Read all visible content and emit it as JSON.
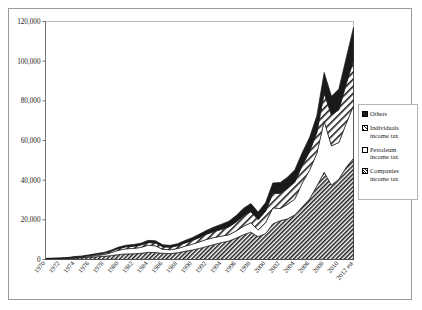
{
  "chart_data": {
    "type": "area",
    "stacked": true,
    "title": "",
    "xlabel": "",
    "ylabel": "",
    "ylim": [
      0,
      120000
    ],
    "yticks": [
      0,
      20000,
      40000,
      60000,
      80000,
      100000,
      120000
    ],
    "ytick_labels": [
      "0",
      "20,000",
      "40,000",
      "60,000",
      "80,000",
      "100,000",
      "120,000"
    ],
    "grid": false,
    "legend_position": "right",
    "x": [
      1970,
      1971,
      1972,
      1973,
      1974,
      1975,
      1976,
      1977,
      1978,
      1979,
      1980,
      1981,
      1982,
      1983,
      1984,
      1985,
      1986,
      1987,
      1988,
      1989,
      1990,
      1991,
      1992,
      1993,
      1994,
      1995,
      1996,
      1997,
      1998,
      1999,
      2000,
      2001,
      2002,
      2003,
      2004,
      2005,
      2006,
      2007,
      2008,
      2009,
      2010,
      2011,
      2012
    ],
    "xtick_labels": [
      "1970",
      "1972",
      "1974",
      "1976",
      "1978",
      "1980",
      "1982",
      "1984",
      "1986",
      "1988",
      "1990",
      "1992",
      "1994",
      "1996",
      "1998",
      "2000",
      "2002",
      "2004",
      "2006",
      "2008",
      "2010",
      "2012 est"
    ],
    "series": [
      {
        "name": "Companies income tax",
        "pattern": "fine-diagonal-hatch",
        "color": "#1a1a1a",
        "values": [
          280,
          340,
          400,
          520,
          760,
          900,
          1150,
          1400,
          1600,
          2000,
          2500,
          2800,
          2900,
          3100,
          3600,
          3500,
          3100,
          3000,
          3400,
          4100,
          4800,
          5600,
          6600,
          7600,
          8500,
          9300,
          10800,
          12500,
          13800,
          11500,
          13000,
          18000,
          19500,
          20500,
          22500,
          26500,
          30500,
          37000,
          44000,
          37500,
          40500,
          46500,
          51000
        ]
      },
      {
        "name": "Petroleum income tax",
        "pattern": "white",
        "color": "#ffffff",
        "values": [
          0,
          0,
          0,
          0,
          120,
          200,
          420,
          700,
          900,
          1500,
          2200,
          2600,
          2700,
          3000,
          3600,
          3400,
          2000,
          1900,
          2100,
          2600,
          2900,
          3300,
          3600,
          3500,
          3300,
          3200,
          3600,
          4300,
          4700,
          3400,
          5500,
          8000,
          6200,
          7300,
          8000,
          12000,
          14500,
          16500,
          25800,
          19800,
          18500,
          22000,
          26500
        ]
      },
      {
        "name": "Individuals income tax",
        "pattern": "wide-diagonal-hatch",
        "color": "#1a1a1a",
        "values": [
          180,
          200,
          230,
          280,
          340,
          400,
          460,
          540,
          620,
          740,
          900,
          1020,
          1100,
          1180,
          1350,
          1400,
          1320,
          1280,
          1400,
          1600,
          1850,
          2200,
          2600,
          3000,
          3400,
          3900,
          4500,
          5200,
          5600,
          5200,
          5800,
          7400,
          7700,
          8000,
          8600,
          8800,
          9300,
          10500,
          14000,
          15500,
          16500,
          20000,
          23000
        ]
      },
      {
        "name": "Others",
        "pattern": "solid-black",
        "color": "#1a1a1a",
        "values": [
          120,
          140,
          160,
          200,
          260,
          300,
          340,
          400,
          460,
          560,
          700,
          800,
          860,
          920,
          1100,
          1150,
          1000,
          950,
          1050,
          1250,
          1450,
          1700,
          2000,
          2300,
          2600,
          2900,
          3300,
          3800,
          4100,
          3800,
          4300,
          5200,
          5400,
          5700,
          6100,
          6500,
          7200,
          8500,
          10500,
          9500,
          10500,
          13000,
          16500
        ]
      }
    ]
  },
  "legend": {
    "items": [
      {
        "label_line1": "Others",
        "label_line2": "",
        "swatch": "solid-black"
      },
      {
        "label_line1": "Individuals",
        "label_line2": "income tax",
        "swatch": "wide-diagonal-hatch"
      },
      {
        "label_line1": "Petroleum",
        "label_line2": "income tax",
        "swatch": "white"
      },
      {
        "label_line1": "Companies",
        "label_line2": "income tax",
        "swatch": "fine-diagonal-hatch"
      }
    ]
  }
}
